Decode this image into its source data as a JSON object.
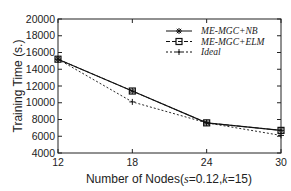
{
  "chart_data": {
    "type": "line",
    "title": "",
    "xlabel": "Number of Nodes(s=0.12,k=15)",
    "xlabel_parts": [
      "Number of Nodes(",
      "s",
      "=0.12,",
      "k",
      "=15)"
    ],
    "ylabel": "Training Time (s.)",
    "x": [
      12,
      18,
      24,
      30
    ],
    "xticks": [
      "12",
      "18",
      "24",
      "30"
    ],
    "yticks": [
      "4000",
      "6000",
      "8000",
      "10000",
      "12000",
      "14000",
      "16000",
      "18000",
      "20000"
    ],
    "xlim": [
      12,
      30
    ],
    "ylim": [
      4000,
      20000
    ],
    "grid": false,
    "legend_position": "upper right",
    "series": [
      {
        "name": "ME-MGC+NB",
        "values": [
          15200,
          11400,
          7600,
          6700
        ],
        "marker": "asterisk",
        "line": "solid",
        "color": "#111111"
      },
      {
        "name": "ME-MGC+ELM",
        "values": [
          15200,
          11400,
          7600,
          6700
        ],
        "marker": "square",
        "line": "dashed",
        "color": "#111111"
      },
      {
        "name": "Ideal",
        "values": [
          15200,
          10100,
          7600,
          6100
        ],
        "marker": "plus",
        "line": "dotted",
        "color": "#111111"
      }
    ]
  }
}
